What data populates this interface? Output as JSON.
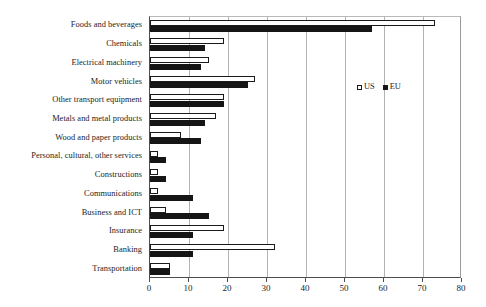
{
  "chart_data": {
    "type": "bar",
    "orientation": "horizontal",
    "title": "",
    "xlabel": "",
    "ylabel": "",
    "xlim": [
      0,
      80
    ],
    "xticks": [
      0,
      10,
      20,
      30,
      40,
      50,
      60,
      70,
      80
    ],
    "xtick_labels": [
      "0",
      "10",
      "20",
      "30",
      "40",
      "50",
      "60",
      "70",
      "80"
    ],
    "grid": true,
    "grid_axis": "x",
    "legend_position": "upper right inside",
    "categories": [
      "Foods and beverages",
      "Chemicals",
      "Electrical machinery",
      "Motor vehicles",
      "Other transport equipment",
      "Metals and metal products",
      "Wood and paper products",
      "Personal, cultural, other services",
      "Constructions",
      "Communications",
      "Business and ICT",
      "Insurance",
      "Banking",
      "Transportation"
    ],
    "series": [
      {
        "name": "US",
        "color": "#ffffff",
        "edge_color": "#1a1a1a",
        "values": [
          73,
          19,
          15,
          27,
          19,
          17,
          8,
          2,
          2,
          2,
          4,
          19,
          32,
          5
        ]
      },
      {
        "name": "EU",
        "color": "#151515",
        "edge_color": "#151515",
        "values": [
          57,
          14,
          13,
          25,
          19,
          14,
          13,
          4,
          4,
          11,
          15,
          11,
          11,
          5
        ]
      }
    ]
  },
  "legend": {
    "items": [
      {
        "label": "US",
        "swatch": "hollow-square-icon"
      },
      {
        "label": "EU",
        "swatch": "filled-square-icon"
      }
    ]
  }
}
